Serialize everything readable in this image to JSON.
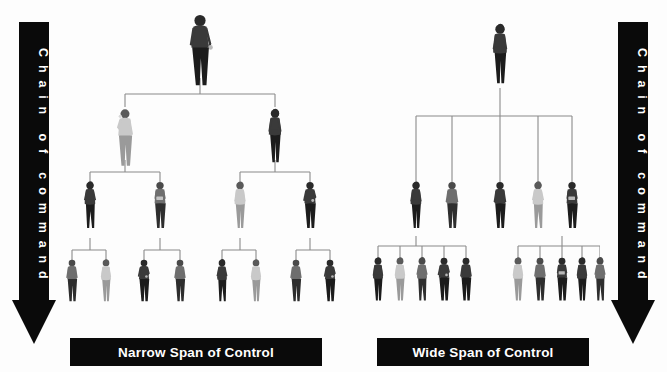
{
  "diagram": {
    "background_color": "#fdfdfd",
    "line_color": "#8a8a8a",
    "bar_color": "#0a0a0a",
    "bar_text_color": "#ffffff"
  },
  "arrows": {
    "left": {
      "label": "Chain of command",
      "label_vertical": "C h a i n   o f   c o m m a n d",
      "direction": "down",
      "color": "#0a0a0a"
    },
    "right": {
      "label": "Chain of command",
      "label_vertical": "C h a i n   o f   c o m m a n d",
      "direction": "down",
      "color": "#0a0a0a"
    }
  },
  "captions": {
    "narrow": "Narrow Span of Control",
    "wide": "Wide Span of Control"
  },
  "chart_data": {
    "type": "diagram",
    "charts": [
      {
        "name": "narrow",
        "caption": "Narrow Span of Control",
        "span": 2,
        "levels": [
          1,
          2,
          4,
          8
        ],
        "total_people": 15,
        "level_labels": [
          "Top executive",
          "Managers",
          "Supervisors",
          "Employees"
        ]
      },
      {
        "name": "wide",
        "caption": "Wide Span of Control",
        "span": 5,
        "levels": [
          1,
          5,
          10
        ],
        "total_people": 16,
        "level_labels": [
          "Top executive",
          "Managers",
          "Employees"
        ]
      }
    ]
  },
  "narrow_chart": {
    "levels": [
      {
        "index": 0,
        "count": 1,
        "y": 12,
        "nodes": [
          {
            "x": 142,
            "pose": "man-standing-gesture",
            "scale": 1.22,
            "tone": "dark"
          }
        ]
      },
      {
        "index": 1,
        "count": 2,
        "y": 107,
        "nodes": [
          {
            "x": 67,
            "pose": "man-phone",
            "scale": 0.98,
            "tone": "light"
          },
          {
            "x": 217,
            "pose": "woman-standing",
            "scale": 0.92,
            "tone": "dark"
          }
        ]
      },
      {
        "index": 2,
        "count": 4,
        "y": 180,
        "nodes": [
          {
            "x": 32,
            "pose": "woman-walking",
            "scale": 0.8,
            "tone": "dark"
          },
          {
            "x": 102,
            "pose": "man-tablet",
            "scale": 0.8,
            "tone": "mid"
          },
          {
            "x": 182,
            "pose": "woman-standing",
            "scale": 0.8,
            "tone": "light"
          },
          {
            "x": 252,
            "pose": "man-gesture",
            "scale": 0.8,
            "tone": "dark"
          }
        ]
      },
      {
        "index": 3,
        "count": 8,
        "y": 258,
        "nodes": [
          {
            "x": 14,
            "pose": "man-standing",
            "scale": 0.72,
            "tone": "mid"
          },
          {
            "x": 48,
            "pose": "woman-standing",
            "scale": 0.72,
            "tone": "light"
          },
          {
            "x": 86,
            "pose": "man-gesture",
            "scale": 0.72,
            "tone": "dark"
          },
          {
            "x": 122,
            "pose": "man-standing",
            "scale": 0.72,
            "tone": "mid"
          },
          {
            "x": 164,
            "pose": "woman-walking",
            "scale": 0.72,
            "tone": "dark"
          },
          {
            "x": 198,
            "pose": "woman-standing",
            "scale": 0.72,
            "tone": "light"
          },
          {
            "x": 238,
            "pose": "man-standing",
            "scale": 0.72,
            "tone": "mid"
          },
          {
            "x": 272,
            "pose": "man-gesture",
            "scale": 0.72,
            "tone": "dark"
          }
        ]
      }
    ],
    "connectors": [
      {
        "type": "v",
        "x": 142,
        "y1": 78,
        "y2": 94
      },
      {
        "type": "h",
        "y": 94,
        "x1": 67,
        "x2": 217
      },
      {
        "type": "v",
        "x": 67,
        "y1": 94,
        "y2": 107
      },
      {
        "type": "v",
        "x": 217,
        "y1": 94,
        "y2": 107
      },
      {
        "type": "v",
        "x": 67,
        "y1": 160,
        "y2": 172
      },
      {
        "type": "h",
        "y": 172,
        "x1": 32,
        "x2": 102
      },
      {
        "type": "v",
        "x": 32,
        "y1": 172,
        "y2": 182
      },
      {
        "type": "v",
        "x": 102,
        "y1": 172,
        "y2": 182
      },
      {
        "type": "v",
        "x": 217,
        "y1": 160,
        "y2": 172
      },
      {
        "type": "h",
        "y": 172,
        "x1": 182,
        "x2": 252
      },
      {
        "type": "v",
        "x": 182,
        "y1": 172,
        "y2": 182
      },
      {
        "type": "v",
        "x": 252,
        "y1": 172,
        "y2": 182
      },
      {
        "type": "v",
        "x": 32,
        "y1": 238,
        "y2": 250
      },
      {
        "type": "h",
        "y": 250,
        "x1": 14,
        "x2": 48
      },
      {
        "type": "v",
        "x": 14,
        "y1": 250,
        "y2": 262
      },
      {
        "type": "v",
        "x": 48,
        "y1": 250,
        "y2": 262
      },
      {
        "type": "v",
        "x": 102,
        "y1": 238,
        "y2": 250
      },
      {
        "type": "h",
        "y": 250,
        "x1": 86,
        "x2": 122
      },
      {
        "type": "v",
        "x": 86,
        "y1": 250,
        "y2": 262
      },
      {
        "type": "v",
        "x": 122,
        "y1": 250,
        "y2": 262
      },
      {
        "type": "v",
        "x": 182,
        "y1": 238,
        "y2": 250
      },
      {
        "type": "h",
        "y": 250,
        "x1": 164,
        "x2": 198
      },
      {
        "type": "v",
        "x": 164,
        "y1": 250,
        "y2": 262
      },
      {
        "type": "v",
        "x": 198,
        "y1": 250,
        "y2": 262
      },
      {
        "type": "v",
        "x": 252,
        "y1": 238,
        "y2": 250
      },
      {
        "type": "h",
        "y": 250,
        "x1": 238,
        "x2": 272
      },
      {
        "type": "v",
        "x": 238,
        "y1": 250,
        "y2": 262
      },
      {
        "type": "v",
        "x": 272,
        "y1": 250,
        "y2": 262
      }
    ]
  },
  "wide_chart": {
    "levels": [
      {
        "index": 0,
        "count": 1,
        "y": 22,
        "nodes": [
          {
            "x": 140,
            "pose": "woman-standing",
            "scale": 1.02,
            "tone": "dark"
          }
        ]
      },
      {
        "index": 1,
        "count": 5,
        "y": 180,
        "nodes": [
          {
            "x": 56,
            "pose": "woman-standing",
            "scale": 0.8,
            "tone": "dark"
          },
          {
            "x": 92,
            "pose": "man-standing",
            "scale": 0.8,
            "tone": "mid"
          },
          {
            "x": 140,
            "pose": "man-standing",
            "scale": 0.8,
            "tone": "dark"
          },
          {
            "x": 178,
            "pose": "woman-walking",
            "scale": 0.8,
            "tone": "light"
          },
          {
            "x": 212,
            "pose": "man-tablet",
            "scale": 0.8,
            "tone": "dark"
          }
        ]
      },
      {
        "index": 2,
        "count": 10,
        "y": 256,
        "nodes": [
          {
            "x": 18,
            "pose": "woman-standing",
            "scale": 0.74,
            "tone": "dark"
          },
          {
            "x": 40,
            "pose": "woman-standing",
            "scale": 0.74,
            "tone": "light"
          },
          {
            "x": 62,
            "pose": "woman-walking",
            "scale": 0.74,
            "tone": "mid"
          },
          {
            "x": 84,
            "pose": "man-gesture",
            "scale": 0.74,
            "tone": "dark"
          },
          {
            "x": 106,
            "pose": "man-standing",
            "scale": 0.74,
            "tone": "dark"
          },
          {
            "x": 158,
            "pose": "woman-standing",
            "scale": 0.74,
            "tone": "light"
          },
          {
            "x": 180,
            "pose": "man-standing",
            "scale": 0.74,
            "tone": "mid"
          },
          {
            "x": 202,
            "pose": "man-tablet",
            "scale": 0.74,
            "tone": "dark"
          },
          {
            "x": 222,
            "pose": "woman-standing",
            "scale": 0.74,
            "tone": "dark"
          },
          {
            "x": 240,
            "pose": "woman-walking",
            "scale": 0.74,
            "tone": "mid"
          }
        ]
      }
    ],
    "connectors": [
      {
        "type": "v",
        "x": 140,
        "y1": 88,
        "y2": 116
      },
      {
        "type": "h",
        "y": 116,
        "x1": 56,
        "x2": 212
      },
      {
        "type": "v",
        "x": 56,
        "y1": 116,
        "y2": 182
      },
      {
        "type": "v",
        "x": 92,
        "y1": 116,
        "y2": 182
      },
      {
        "type": "v",
        "x": 140,
        "y1": 116,
        "y2": 182
      },
      {
        "type": "v",
        "x": 178,
        "y1": 116,
        "y2": 182
      },
      {
        "type": "v",
        "x": 212,
        "y1": 116,
        "y2": 182
      },
      {
        "type": "v",
        "x": 56,
        "y1": 236,
        "y2": 246
      },
      {
        "type": "h",
        "y": 246,
        "x1": 18,
        "x2": 106
      },
      {
        "type": "v",
        "x": 18,
        "y1": 246,
        "y2": 258
      },
      {
        "type": "v",
        "x": 40,
        "y1": 246,
        "y2": 258
      },
      {
        "type": "v",
        "x": 62,
        "y1": 246,
        "y2": 258
      },
      {
        "type": "v",
        "x": 84,
        "y1": 246,
        "y2": 258
      },
      {
        "type": "v",
        "x": 106,
        "y1": 246,
        "y2": 258
      },
      {
        "type": "v",
        "x": 202,
        "y1": 236,
        "y2": 246
      },
      {
        "type": "h",
        "y": 246,
        "x1": 158,
        "x2": 240
      },
      {
        "type": "v",
        "x": 158,
        "y1": 246,
        "y2": 258
      },
      {
        "type": "v",
        "x": 180,
        "y1": 246,
        "y2": 258
      },
      {
        "type": "v",
        "x": 202,
        "y1": 246,
        "y2": 258
      },
      {
        "type": "v",
        "x": 222,
        "y1": 246,
        "y2": 258
      },
      {
        "type": "v",
        "x": 240,
        "y1": 246,
        "y2": 258
      }
    ]
  }
}
